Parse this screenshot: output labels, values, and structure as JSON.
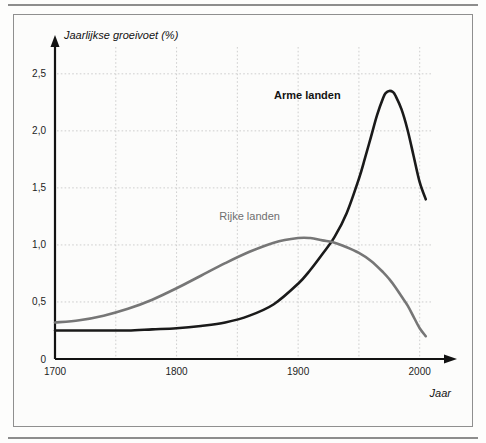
{
  "figure": {
    "background_color": "#fcfcfb",
    "border_color": "#8f8f8f",
    "rule_color": "#8d8d8d"
  },
  "chart_data": {
    "type": "line",
    "title": "",
    "xlabel": "Jaar",
    "ylabel": "Jaarlijkse groeivoet (%)",
    "xlim": [
      1700,
      2020
    ],
    "ylim": [
      0,
      2.7
    ],
    "grid": true,
    "legend_position": "inline-labels",
    "x_ticks": [
      1700,
      1800,
      1900,
      2000
    ],
    "x_tick_labels": [
      "1700",
      "1800",
      "1900",
      "2000"
    ],
    "x_gridlines": [
      1750,
      1800,
      1850,
      1900,
      1950,
      2000
    ],
    "y_ticks": [
      0,
      0.5,
      1.0,
      1.5,
      2.0,
      2.5
    ],
    "y_tick_labels": [
      "0",
      "0,5",
      "1,0",
      "1,5",
      "2,0",
      "2,5"
    ],
    "y_gridlines": [
      0.5,
      1.0,
      1.5,
      2.0,
      2.5
    ],
    "series": [
      {
        "name": "Arme landen",
        "color": "#1a1a1a",
        "width": 2.6,
        "label_x": 1935,
        "label_y": 2.28,
        "label_anchor": "end",
        "x": [
          1700,
          1720,
          1740,
          1760,
          1780,
          1800,
          1820,
          1840,
          1860,
          1880,
          1900,
          1910,
          1920,
          1930,
          1940,
          1950,
          1955,
          1960,
          1965,
          1970,
          1972,
          1975,
          1978,
          1980,
          1985,
          1990,
          1995,
          2000,
          2005
        ],
        "y": [
          0.25,
          0.25,
          0.25,
          0.25,
          0.26,
          0.27,
          0.29,
          0.32,
          0.38,
          0.48,
          0.66,
          0.78,
          0.92,
          1.07,
          1.28,
          1.58,
          1.76,
          1.95,
          2.14,
          2.29,
          2.33,
          2.35,
          2.34,
          2.31,
          2.19,
          2.01,
          1.78,
          1.55,
          1.4
        ]
      },
      {
        "name": "Rijke landen",
        "color": "#767676",
        "width": 2.6,
        "label_x": 1885,
        "label_y": 1.22,
        "label_anchor": "end",
        "x": [
          1700,
          1720,
          1740,
          1760,
          1780,
          1800,
          1820,
          1840,
          1860,
          1880,
          1900,
          1910,
          1920,
          1930,
          1940,
          1950,
          1960,
          1970,
          1975,
          1980,
          1985,
          1990,
          1995,
          2000,
          2005
        ],
        "y": [
          0.32,
          0.34,
          0.38,
          0.44,
          0.52,
          0.62,
          0.73,
          0.84,
          0.94,
          1.02,
          1.06,
          1.06,
          1.04,
          1.02,
          0.98,
          0.93,
          0.86,
          0.76,
          0.7,
          0.63,
          0.55,
          0.47,
          0.37,
          0.27,
          0.2
        ]
      }
    ],
    "peak_annotations": [
      {
        "series": "Arme landen",
        "x": 1975,
        "y": 2.35
      },
      {
        "series": "Rijke landen",
        "x": 1902,
        "y": 1.06
      }
    ],
    "crossing_point": {
      "x": 1932,
      "y": 1.03
    }
  }
}
